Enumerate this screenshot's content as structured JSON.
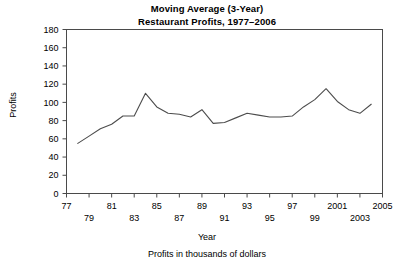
{
  "chart_data": {
    "type": "line",
    "title": "Moving Average (3-Year)",
    "subtitle": "Restaurant Profits, 1977–2006",
    "xlabel": "Year",
    "ylabel": "Profits",
    "footnote": "Profits in thousands of dollars",
    "xlim": [
      1977,
      2005
    ],
    "ylim": [
      0,
      180
    ],
    "grid": false,
    "legend": false,
    "y_ticks": [
      0,
      20,
      40,
      60,
      80,
      100,
      120,
      140,
      160,
      180
    ],
    "x_ticks": [
      1977,
      1979,
      1981,
      1983,
      1985,
      1987,
      1989,
      1991,
      1993,
      1995,
      1997,
      1999,
      2001,
      2003,
      2005
    ],
    "x_tick_labels_upper": [
      "77",
      "81",
      "85",
      "89",
      "93",
      "97",
      "2001",
      "2005"
    ],
    "x_tick_labels_lower": [
      "79",
      "83",
      "87",
      "91",
      "95",
      "99",
      "2003"
    ],
    "series": [
      {
        "name": "3-Year Moving Average of Restaurant Profits",
        "x": [
          1978,
          1979,
          1980,
          1981,
          1982,
          1983,
          1984,
          1985,
          1986,
          1987,
          1988,
          1989,
          1990,
          1991,
          1992,
          1993,
          1994,
          1995,
          1996,
          1997,
          1998,
          1999,
          2000,
          2001,
          2002,
          2003,
          2004
        ],
        "values": [
          55,
          63,
          71,
          76,
          85,
          85,
          110,
          95,
          88,
          87,
          84,
          92,
          77,
          78,
          83,
          88,
          86,
          84,
          84,
          85,
          95,
          103,
          115,
          101,
          92,
          88,
          98
        ]
      }
    ]
  }
}
